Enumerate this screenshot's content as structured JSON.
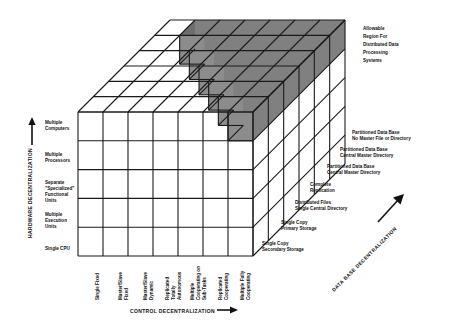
{
  "figure": {
    "type": "3d-cube-classification-diagram",
    "background": "#ffffff",
    "line_color": "#1a1a1a",
    "shade_color": "#808080"
  },
  "axes": {
    "vertical": {
      "title": "HARDWARE DECENTRALIZATION",
      "arrow": "up-arrow-icon",
      "ticks": [
        "Multiple\nComputers",
        "Multiple\nProcessors",
        "Separate\n\"Specialized\"\nFunctional\nUnits",
        "Multiple\nExecution\nUnits",
        "Single CPU"
      ],
      "tick_lines": [
        [
          "Multiple",
          "Computers"
        ],
        [
          "Multiple",
          "Processors"
        ],
        [
          "Separate",
          "\"Specialized\"",
          "Functional",
          "Units"
        ],
        [
          "Multiple",
          "Execution",
          "Units"
        ],
        [
          "Single CPU"
        ]
      ]
    },
    "horizontal": {
      "title": "CONTROL DECENTRALIZATION",
      "arrow": "right-arrow-icon",
      "ticks": [
        [
          "Single Fixed"
        ],
        [
          "Master/Slave",
          "Fixed"
        ],
        [
          "Master/Slave",
          "Dynamic"
        ],
        [
          "Replicated",
          "Totally",
          "Autonomous"
        ],
        [
          "Multiple",
          "Cooperating on",
          "Sub-Tasks"
        ],
        [
          "Replicated",
          "Cooperating"
        ],
        [
          "Multiple Fully",
          "Cooperating"
        ]
      ]
    },
    "depth": {
      "title": "DATA BASE DECENTRALIZATION",
      "arrow": "diagonal-arrow-icon",
      "ticks": [
        [
          "Single Copy",
          "Secondary Storage"
        ],
        [
          "Single Copy",
          "Primary Storage"
        ],
        [
          "Distributed Files",
          "Single Central Directory"
        ],
        [
          "Complete",
          "Replication"
        ],
        [
          "Partitioned Data Base",
          "Central Master Directory"
        ],
        [
          "Partitioned Data Base",
          "Central Master Directory"
        ],
        [
          "Partitioned Data Base",
          "No Master File or Directory"
        ]
      ]
    }
  },
  "annotation": {
    "allowable_region": [
      "Allowable",
      "Region For",
      "Distributed Data",
      "Processing",
      "Systems"
    ]
  },
  "chart_data": {
    "type": "heatmap",
    "title": "Allowable Region For Distributed Data Processing Systems",
    "x": [
      "Single Fixed",
      "Master/Slave Fixed",
      "Master/Slave Dynamic",
      "Replicated Totally Autonomous",
      "Multiple Cooperating on Sub-Tasks",
      "Replicated Cooperating",
      "Multiple Fully Cooperating"
    ],
    "y": [
      "Single CPU",
      "Multiple Execution Units",
      "Separate \"Specialized\" Functional Units",
      "Multiple Processors",
      "Multiple Computers"
    ],
    "z": [
      "Single Copy Secondary Storage",
      "Single Copy Primary Storage",
      "Distributed Files Single Central Directory",
      "Complete Replication",
      "Partitioned Data Base Central Master Directory",
      "Partitioned Data Base Central Master Directory",
      "Partitioned Data Base No Master File or Directory"
    ],
    "xlabel": "CONTROL DECENTRALIZATION",
    "ylabel": "HARDWARE DECENTRALIZATION",
    "zlabel": "DATA BASE DECENTRALIZATION",
    "grid": true,
    "legend": "none",
    "shaded_region_description": "Staircase-shaped shaded volume at the high end of all three axes denoting the allowable region for distributed data processing systems"
  }
}
